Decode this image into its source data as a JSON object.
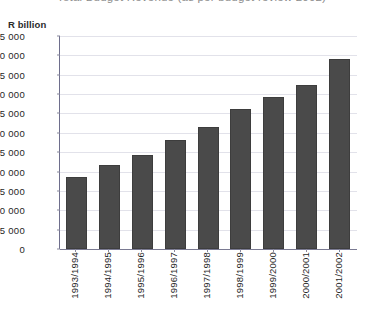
{
  "chart_data": {
    "type": "bar",
    "title": "Total Budget Revenue (as per budget review 2002)",
    "subtitle": "",
    "xlabel": "",
    "ylabel": "R billion",
    "ylim": [
      0,
      275000
    ],
    "ytick_step": 25000,
    "grid": true,
    "legend": "none",
    "bar_color": "#4a4a4a",
    "gridline_color": "#e2e2ea",
    "axis_color": "#6e6e8c",
    "categories": [
      "1993/1994",
      "1994/1995",
      "1995/1996",
      "1996/1997",
      "1997/1998",
      "1998/1999",
      "1999/2000",
      "2000/2001",
      "2001/2002"
    ],
    "values": [
      93000,
      108000,
      122000,
      141000,
      157000,
      181000,
      196000,
      212000,
      245000
    ],
    "ytick_labels": [
      "0",
      "25 000",
      "50 000",
      "75 000",
      "100 000",
      "125 000",
      "150 000",
      "175 000",
      "200 000",
      "225 000",
      "250 000",
      "275 000"
    ],
    "ytick_values": [
      0,
      25000,
      50000,
      75000,
      100000,
      125000,
      150000,
      175000,
      200000,
      225000,
      250000,
      275000
    ]
  }
}
